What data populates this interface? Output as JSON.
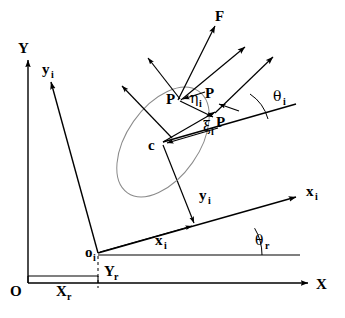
{
  "figure": {
    "background_color": "#ffffff",
    "line_color": "#000000",
    "ellipse_color": "#8a8a8a",
    "width": 345,
    "height": 318
  },
  "labels": {
    "global_y_axis": "Y",
    "global_x_axis": "X",
    "global_origin": "O",
    "body_y_axis": "y",
    "body_y_axis_sub": "i",
    "body_x_axis": "x",
    "body_x_axis_sub": "i",
    "body_origin": "o",
    "body_origin_sub": "i",
    "offset_x": "X",
    "offset_x_sub": "r",
    "offset_y": "Y",
    "offset_y_sub": "r",
    "coord_x": "x",
    "coord_x_sub": "i",
    "coord_y": "y",
    "coord_y_sub": "i",
    "angle_r": "θ",
    "angle_r_sub": "r",
    "angle_i": "θ",
    "angle_i_sub": "i",
    "force": "F",
    "point_p": "P",
    "center_c": "c",
    "eta_axis": "η",
    "eta_axis_sub": "i",
    "eta_axis_point": "P",
    "xi_axis": "ξ",
    "xi_axis_sub": "i",
    "xi_axis_point": "P"
  },
  "geometry": {
    "global_origin_point": [
      28,
      283
    ],
    "body_origin_point": [
      98,
      253
    ],
    "ellipse_center": [
      163,
      142
    ],
    "point_p": [
      180,
      98
    ],
    "global_x_axis_end": [
      310,
      283
    ],
    "global_y_axis_top": [
      28,
      58
    ],
    "body_x_axis_end": [
      298,
      196
    ],
    "body_y_axis_end": [
      49,
      79
    ],
    "force_arrow_tip": [
      216,
      22
    ],
    "theta_r_degrees": 15,
    "theta_i_degrees": 42,
    "ellipse_rx": 62,
    "ellipse_ry": 36,
    "ellipse_rotation_degrees": -55
  }
}
